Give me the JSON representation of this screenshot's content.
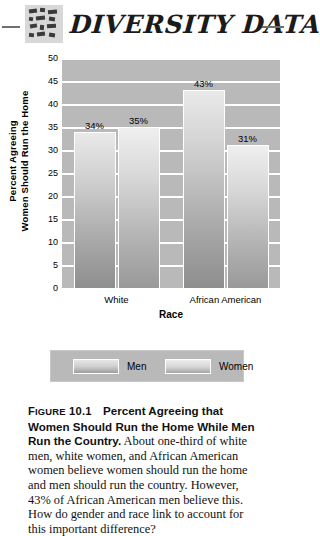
{
  "header": {
    "title": "DIVERSITY DATA",
    "glyph_icon": "textured-tile-block-icon",
    "rule_left": "decorative-rule-left",
    "rule_right": "decorative-rule-right"
  },
  "chart_data": {
    "type": "bar",
    "title": "",
    "categories": [
      "White",
      "African American"
    ],
    "series": [
      {
        "name": "Men",
        "values": [
          34,
          35
        ]
      },
      {
        "name": "Women",
        "values": [
          43,
          31
        ]
      }
    ],
    "bars": [
      {
        "category": "White",
        "series": "Men",
        "value": 34,
        "label": "34%"
      },
      {
        "category": "White",
        "series": "Women",
        "value": 35,
        "label": "35%"
      },
      {
        "category": "African American",
        "series": "Men",
        "value": 43,
        "label": "43%"
      },
      {
        "category": "African American",
        "series": "Women",
        "value": 31,
        "label": "31%"
      }
    ],
    "xlabel": "Race",
    "ylabel": "Percent Agreeing Women Should Run the Home",
    "ylabel_line1": "Percent Agreeing",
    "ylabel_line2": "Women Should Run the Home",
    "ylim": [
      0,
      50
    ],
    "ystep": 5,
    "yticks": [
      "50",
      "45",
      "40",
      "35",
      "30",
      "25",
      "20",
      "15",
      "10",
      "5",
      "0"
    ],
    "grid": true,
    "legend_position": "bottom",
    "colors": {
      "plot_background": "#b9b9b9",
      "gridline": "#ffffff",
      "bar_top": "#ececec",
      "bar_bottom": "#959595",
      "bar_border": "#ffffff",
      "text": "#000000"
    }
  },
  "legend": {
    "items": [
      {
        "label": "Men",
        "swatch": "men-swatch"
      },
      {
        "label": "Women",
        "swatch": "women-swatch"
      }
    ]
  },
  "caption": {
    "figure_label": "FIGURE",
    "figure_number": "10.1",
    "title": "Percent Agreeing that Women Should Run the Home While Men Run the Country.",
    "body": "About one-third of white men, white women, and African American women believe women should run the home and men should run the country. However, 43% of African American men believe this. How do gender and race link to account for this important difference?"
  }
}
